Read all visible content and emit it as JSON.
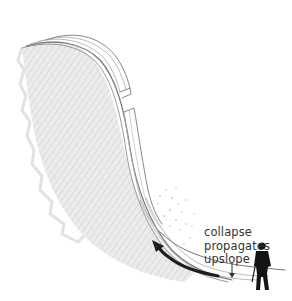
{
  "diagram": {
    "type": "illustration",
    "caption_lines": [
      "collapse",
      "propagates",
      "upslope"
    ],
    "elements": {
      "terrain": "hatched snow-covered slope",
      "snowpack": "layered slab with fractures",
      "arrow": "upslope propagation arrow",
      "collapse_marker": "small downward arrow",
      "figure": "silhouette of person with pole"
    },
    "colors": {
      "background": "#ffffff",
      "terrain_hatch": "#d6d6d6",
      "slab_lines": "#8a8a8a",
      "arrow": "#1e1e1e",
      "figure": "#141414",
      "text": "#333333"
    }
  }
}
